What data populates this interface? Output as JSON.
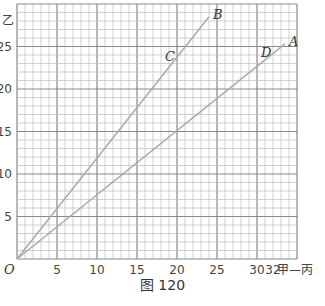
{
  "caption": "图 120",
  "chart_data": {
    "type": "line",
    "title": "",
    "caption": "图 120",
    "xlabel": "甲—丙",
    "ylabel": "乙",
    "origin_label": "O",
    "xlim": [
      0,
      35
    ],
    "ylim": [
      0,
      30
    ],
    "x_ticks": [
      5,
      10,
      15,
      20,
      25,
      30,
      32
    ],
    "y_ticks": [
      5,
      10,
      15,
      20,
      25
    ],
    "grid": true,
    "series": [
      {
        "name": "OB",
        "x": [
          0,
          24
        ],
        "y": [
          0,
          28.5
        ],
        "points": [
          {
            "label": "C",
            "x": 20,
            "y": 23.5
          },
          {
            "label": "B",
            "x": 24,
            "y": 28.5
          }
        ]
      },
      {
        "name": "OA",
        "x": [
          0,
          33.5
        ],
        "y": [
          0,
          25.3
        ],
        "points": [
          {
            "label": "D",
            "x": 32,
            "y": 24
          },
          {
            "label": "A",
            "x": 33.5,
            "y": 25.3
          }
        ]
      }
    ]
  }
}
